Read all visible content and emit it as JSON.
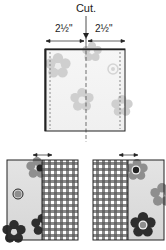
{
  "diagram": {
    "cut_label": "Cut.",
    "dimensions": {
      "left": "2½\"",
      "right": "2½\""
    },
    "colors": {
      "line": "#222222",
      "flower_light": "#c8c8c8",
      "flower_mid": "#8a8a8a",
      "flower_dark": "#2e2e2e",
      "print_bg_top": "#f6f6f6",
      "print_bg_bottom": "#dcdcdc",
      "gingham_dark": "#333333"
    },
    "panels": [
      {
        "name": "original-square",
        "description": "Floral square with center cut line"
      },
      {
        "name": "left-pieced-block",
        "description": "Floral half sewn to gingham strip on right"
      },
      {
        "name": "right-pieced-block",
        "description": "Gingham strip sewn to floral half on right"
      }
    ]
  }
}
